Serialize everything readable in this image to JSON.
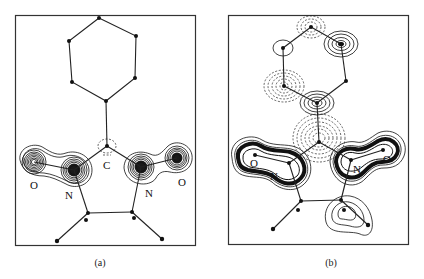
{
  "figure": {
    "panels": [
      {
        "id": "a",
        "caption": "(a)",
        "atom_labels": [
          {
            "text": "O",
            "x": 30,
            "y": 189
          },
          {
            "text": "N",
            "x": 65,
            "y": 199
          },
          {
            "text": "C",
            "x": 103,
            "y": 169
          },
          {
            "text": "N",
            "x": 145,
            "y": 197
          },
          {
            "text": "O",
            "x": 178,
            "y": 186
          }
        ]
      },
      {
        "id": "b",
        "caption": "(b)",
        "atom_labels": [
          {
            "text": "O",
            "x": 250,
            "y": 167
          },
          {
            "text": "N",
            "x": 270,
            "y": 180
          },
          {
            "text": "N",
            "x": 353,
            "y": 173
          },
          {
            "text": "O",
            "x": 383,
            "y": 163
          }
        ]
      }
    ],
    "legend": {
      "solid_contours": "positive density",
      "dashed_contours": "negative density"
    }
  }
}
